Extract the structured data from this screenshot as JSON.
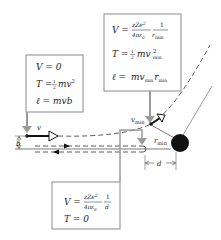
{
  "diagram": {
    "type": "rutherford-scattering-trajectories",
    "colors": {
      "box_border": "#8a8a8a",
      "gray_arrow": "#9a9a9a",
      "line": "#333333",
      "nucleus": "#111111",
      "background": "#ffffff"
    },
    "top_box": {
      "V_lhs": "V =",
      "V_num": "zZe",
      "V_num_sup": "2",
      "V_den": "4πε",
      "V_den_sub": "0",
      "V_frac2_num": "1",
      "V_frac2_den": "r",
      "V_frac2_den_sub": "min",
      "T_lhs": "T =",
      "T_half_num": "1",
      "T_half_den": "2",
      "T_rhs": "mv",
      "T_sup": "2",
      "T_sub": "min",
      "l_lhs": "ℓ =",
      "l_rhs1": "mv",
      "l_sub1": "min",
      "l_rhs2": "r",
      "l_sub2": "min"
    },
    "left_box": {
      "V_line": "V = 0",
      "T_lhs": "T =",
      "T_half_num": "1",
      "T_half_den": "2",
      "T_rhs": "mv",
      "T_sup": "2",
      "l_line": "ℓ = mvb"
    },
    "bottom_box": {
      "V_lhs": "V =",
      "V_num": "zZe",
      "V_num_sup": "2",
      "V_den": "4πε",
      "V_den_sub": "0",
      "V_frac2_num": "1",
      "V_frac2_den": "d",
      "T_line": "T = 0"
    },
    "labels": {
      "v": "v",
      "v_min": "v",
      "v_min_sub": "min",
      "r_min": "r",
      "r_min_sub": "min",
      "b": "b",
      "d": "d"
    }
  }
}
